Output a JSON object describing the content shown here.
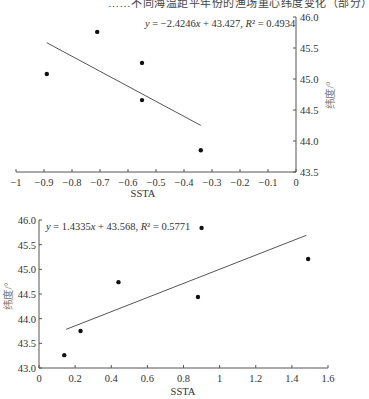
{
  "header": {
    "caption_fragment": "……不同海温距平年份的渔场重心纬度变化（部分）"
  },
  "chart_data": [
    {
      "type": "scatter",
      "title": "",
      "xlabel": "SSTA",
      "ylabel": "纬度/°",
      "xlim": [
        -1,
        0
      ],
      "ylim": [
        43.5,
        46.0
      ],
      "x_ticks": [
        "-1",
        "-0.9",
        "-0.8",
        "-0.7",
        "-0.6",
        "-0.5",
        "-0.4",
        "-0.3",
        "-0.2",
        "-0.1",
        "0"
      ],
      "y_ticks": [
        "43.5",
        "44.0",
        "44.5",
        "45.0",
        "45.5",
        "46.0"
      ],
      "y_axis_position": "right",
      "grid": false,
      "points": [
        {
          "x": -0.89,
          "y": 45.08
        },
        {
          "x": -0.71,
          "y": 45.76
        },
        {
          "x": -0.55,
          "y": 45.26
        },
        {
          "x": -0.55,
          "y": 44.66
        },
        {
          "x": -0.34,
          "y": 43.85
        }
      ],
      "trendline": {
        "slope": -2.4246,
        "intercept": 43.427,
        "r2": 0.4934,
        "x_range": [
          -0.89,
          -0.34
        ],
        "equation_text": "y = −2.4246x + 43.427, R² = 0.4934"
      }
    },
    {
      "type": "scatter",
      "title": "",
      "xlabel": "SSTA",
      "ylabel": "纬度/°",
      "xlim": [
        0,
        1.6
      ],
      "ylim": [
        43.0,
        46.0
      ],
      "x_ticks": [
        "0",
        "0.2",
        "0.4",
        "0.6",
        "0.8",
        "1",
        "1.2",
        "1.4",
        "1.6"
      ],
      "y_ticks": [
        "43.0",
        "43.5",
        "44.0",
        "44.5",
        "45.0",
        "45.5",
        "46.0"
      ],
      "y_axis_position": "left",
      "grid": false,
      "points": [
        {
          "x": 0.14,
          "y": 43.26
        },
        {
          "x": 0.23,
          "y": 43.75
        },
        {
          "x": 0.44,
          "y": 44.74
        },
        {
          "x": 0.88,
          "y": 44.44
        },
        {
          "x": 0.9,
          "y": 45.84
        },
        {
          "x": 1.49,
          "y": 45.21
        }
      ],
      "trendline": {
        "slope": 1.4335,
        "intercept": 43.568,
        "r2": 0.5771,
        "x_range": [
          0.15,
          1.48
        ],
        "equation_text": "y = 1.4335x + 43.568, R² = 0.5771"
      }
    }
  ]
}
